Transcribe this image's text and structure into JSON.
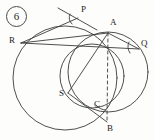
{
  "figure": {
    "number_label": "6",
    "kind": "geometry-diagram",
    "stroke_color": "#3b3b3b",
    "background_color": "#fdfdfb",
    "width": 154,
    "height": 140
  },
  "points": [
    {
      "id": "P",
      "label": "P",
      "x": 78,
      "y": 18,
      "label_x": 81,
      "label_y": 8
    },
    {
      "id": "A",
      "label": "A",
      "x": 108,
      "y": 33,
      "label_x": 110,
      "label_y": 21
    },
    {
      "id": "Q",
      "label": "Q",
      "x": 139,
      "y": 49,
      "label_x": 141,
      "label_y": 41
    },
    {
      "id": "R",
      "label": "R",
      "x": 21,
      "y": 43,
      "label_x": 10,
      "label_y": 36
    },
    {
      "id": "S",
      "label": "S",
      "x": 68,
      "y": 93,
      "label_x": 60,
      "label_y": 92
    },
    {
      "id": "B",
      "label": "B",
      "x": 107,
      "y": 122,
      "label_x": 108,
      "label_y": 124
    },
    {
      "id": "C",
      "label": "C",
      "x": 97,
      "y": 110,
      "label_x": 95,
      "label_y": 103
    }
  ],
  "circles": [
    {
      "id": "big-left-circle",
      "cx": 65,
      "cy": 78,
      "r": 52
    },
    {
      "id": "right-circle",
      "cx": 108,
      "cy": 72,
      "r": 40
    },
    {
      "id": "inner-circle",
      "cx": 92,
      "cy": 76,
      "r": 32
    }
  ],
  "segments": [
    {
      "id": "chord-R-A",
      "from": "R",
      "to": "A"
    },
    {
      "id": "chord-R-P",
      "from": "R",
      "to": "P"
    },
    {
      "id": "chord-R-S-Q",
      "from": "R",
      "to": "Q"
    },
    {
      "id": "chord-S-A",
      "from": "S",
      "to": "A"
    },
    {
      "id": "chord-S-B",
      "from": "S",
      "to": "B"
    },
    {
      "id": "chord-A-Q",
      "from": "A",
      "to": "Q"
    },
    {
      "id": "tangent-at-P",
      "from": "tangent-start",
      "to": "tangent-end"
    }
  ],
  "dashed_segments": [
    {
      "id": "dashed-A-B",
      "from": "A",
      "to": "B"
    }
  ],
  "angle_marks": [
    {
      "id": "angle-at-P",
      "vertex": "P"
    },
    {
      "id": "angle-at-Q",
      "vertex": "Q"
    },
    {
      "id": "angle-at-B",
      "vertex": "B"
    }
  ]
}
